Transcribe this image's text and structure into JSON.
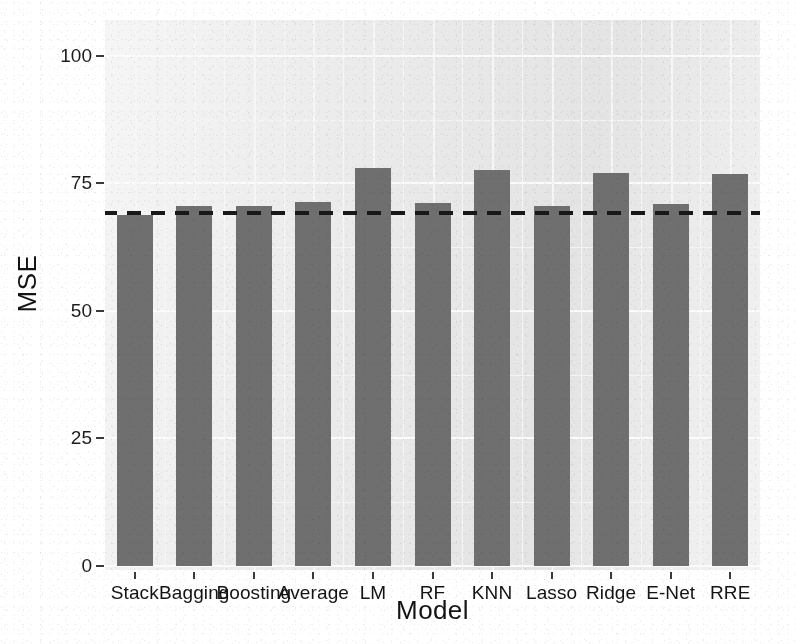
{
  "chart_data": {
    "type": "bar",
    "title": "",
    "xlabel": "Model",
    "ylabel": "MSE",
    "categories": [
      "Stack",
      "Bagging",
      "Boosting",
      "Average",
      "LM",
      "RF",
      "KNN",
      "Lasso",
      "Ridge",
      "E-Net",
      "RRE"
    ],
    "values": [
      68.7,
      70.5,
      70.5,
      71.3,
      77.9,
      71.1,
      77.7,
      70.5,
      77.1,
      70.9,
      76.9
    ],
    "series_name": "MSE",
    "ylim": [
      0,
      107
    ],
    "ytick_values": [
      0,
      25,
      50,
      75,
      100
    ],
    "ytick_labels": [
      "0",
      "25",
      "50",
      "75",
      "100"
    ],
    "grid": true,
    "grid_color": "#fbfbfb",
    "panel_color": "#ebebeb",
    "bar_color": "#6f6f6f",
    "legend": "none",
    "reference_line": {
      "value": 69.1,
      "style": "dashed",
      "color": "#181818",
      "label": ""
    }
  },
  "axes": {
    "y_title": "MSE",
    "x_title": "Model"
  }
}
